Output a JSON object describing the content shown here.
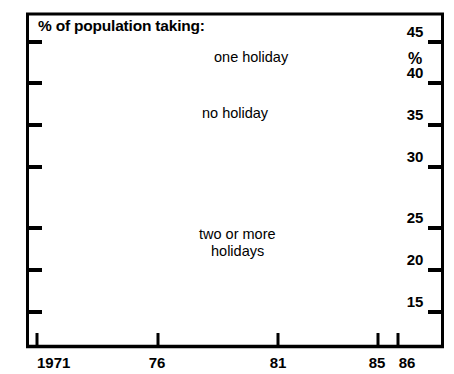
{
  "chart_data": {
    "type": "line",
    "title": "% of population taking:",
    "xlabel": "",
    "ylabel": "%",
    "ylim": [
      12.5,
      46.5
    ],
    "xlim": [
      1971,
      86.6
    ],
    "grid": false,
    "legend_position": "inline-annotations",
    "x_tick_labels": [
      "1971",
      "76",
      "81",
      "85",
      "86"
    ],
    "x_tick_values": [
      1971,
      1976,
      1981,
      1985,
      1986
    ],
    "y_tick_labels": [
      "45",
      "40",
      "35",
      "30",
      "25",
      "20",
      "15"
    ],
    "y_tick_values": [
      45,
      40,
      35,
      30,
      25,
      20,
      15
    ],
    "y_axis_unit_label": "%",
    "series": [
      {
        "name": "one holiday",
        "style": "dashed",
        "label_text": "one holiday",
        "x": [
          1971,
          1972,
          1973,
          1974,
          1975,
          1976,
          1977,
          1978,
          1979,
          1980,
          1981,
          1982,
          1983,
          1984,
          1985,
          1986
        ],
        "values": [
          44.3,
          44.2,
          44.2,
          44.1,
          44.1,
          44.0,
          43.7,
          43.0,
          42.0,
          41.0,
          39.9,
          39.0,
          38.3,
          37.6,
          36.9,
          38.7
        ]
      },
      {
        "name": "no holiday",
        "style": "dotted",
        "label_text": "no holiday",
        "x": [
          1971,
          1972,
          1973,
          1974,
          1975,
          1976,
          1977,
          1978,
          1979,
          1980,
          1981,
          1982,
          1983,
          1984,
          1985,
          1986
        ],
        "values": [
          40.8,
          40.7,
          40.5,
          40.3,
          40.1,
          39.8,
          39.4,
          39.0,
          38.7,
          38.4,
          38.3,
          38.7,
          39.4,
          40.3,
          41.3,
          38.7
        ]
      },
      {
        "name": "two or more holidays",
        "style": "solid",
        "label_text": "two or more holidays",
        "label_line_1": "two or more",
        "label_line_2": "holidays",
        "x": [
          1971,
          1972,
          1973,
          1974,
          1975,
          1976,
          1977,
          1978,
          1979,
          1980,
          1981,
          1982,
          1983,
          1984,
          1985,
          1986
        ],
        "values": [
          14.0,
          14.4,
          14.8,
          15.2,
          15.6,
          16.1,
          17.0,
          17.9,
          18.8,
          19.7,
          20.6,
          20.4,
          20.2,
          20.0,
          19.8,
          19.8
        ]
      }
    ]
  },
  "colors": {
    "ink": "#000000",
    "background": "#ffffff"
  }
}
